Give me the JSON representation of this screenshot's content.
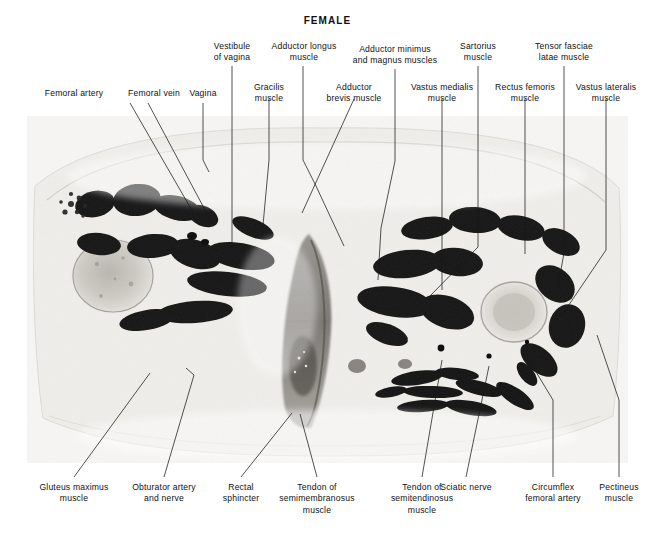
{
  "figure": {
    "title": "FEMALE",
    "type": "anatomical-cross-section-photograph",
    "caption_region": "labeled transverse section of female thighs and perineum"
  },
  "photo": {
    "alt": "black and white transverse anatomical section through female thighs",
    "background_color": "#f4f4f2",
    "ink_color": "#111111"
  },
  "labels": {
    "top_row_1": [
      {
        "id": "femoral-artery",
        "text": "Femoral artery",
        "x": 28,
        "y": 88,
        "w": 92
      },
      {
        "id": "femoral-vein",
        "text": "Femoral vein",
        "x": 112,
        "y": 88,
        "w": 84
      },
      {
        "id": "vagina",
        "text": "Vagina",
        "x": 177,
        "y": 88,
        "w": 52
      },
      {
        "id": "gracilis-muscle",
        "text": "Gracilis\nmuscle",
        "x": 240,
        "y": 82,
        "w": 58
      },
      {
        "id": "adductor-brevis-muscle",
        "text": "Adductor\nbrevis muscle",
        "x": 312,
        "y": 82,
        "w": 84
      },
      {
        "id": "vastus-medialis-muscle",
        "text": "Vastus medialis\nmuscle",
        "x": 396,
        "y": 82,
        "w": 92
      },
      {
        "id": "rectus-femoris-muscle",
        "text": "Rectus femoris\nmuscle",
        "x": 481,
        "y": 82,
        "w": 88
      },
      {
        "id": "vastus-lateralis-muscle",
        "text": "Vastus lateralis\nmuscle",
        "x": 560,
        "y": 82,
        "w": 92
      }
    ],
    "top_row_2": [
      {
        "id": "vestibule-of-vagina",
        "text": "Vestibule\nof vagina",
        "x": 201,
        "y": 41,
        "w": 62
      },
      {
        "id": "adductor-longus-muscle",
        "text": "Adductor longus\nmuscle",
        "x": 256,
        "y": 41,
        "w": 96
      },
      {
        "id": "adductor-minimus-magnus-muscles",
        "text": "Adductor minimus\nand magnus muscles",
        "x": 339,
        "y": 44,
        "w": 112
      },
      {
        "id": "sartorius-muscle",
        "text": "Sartorius\nmuscle",
        "x": 447,
        "y": 41,
        "w": 62
      },
      {
        "id": "tensor-fasciae-latae-muscle",
        "text": "Tensor fasciae\nlatae muscle",
        "x": 518,
        "y": 41,
        "w": 92
      }
    ],
    "bottom_row": [
      {
        "id": "gluteus-maximus-muscle",
        "text": "Gluteus maximus\nmuscle",
        "x": 26,
        "y": 482,
        "w": 96
      },
      {
        "id": "obturator-artery-and-nerve",
        "text": "Obturator artery\nand nerve",
        "x": 116,
        "y": 482,
        "w": 96
      },
      {
        "id": "rectal-sphincter",
        "text": "Rectal\nsphincter",
        "x": 210,
        "y": 482,
        "w": 62
      },
      {
        "id": "tendon-semimembranosus",
        "text": "Tendon of\nsemimembranosus\nmuscle",
        "x": 263,
        "y": 482,
        "w": 108
      },
      {
        "id": "tendon-semitendinosus",
        "text": "Tendon of\nsemitendinosus\nmuscle",
        "x": 372,
        "y": 482,
        "w": 100
      },
      {
        "id": "sciatic-nerve",
        "text": "Sciatic nerve",
        "x": 424,
        "y": 482,
        "w": 84
      },
      {
        "id": "circumflex-femoral-artery",
        "text": "Circumflex\nfemoral artery",
        "x": 505,
        "y": 482,
        "w": 96
      },
      {
        "id": "pectineus-muscle",
        "text": "Pectineus\nmuscle",
        "x": 585,
        "y": 482,
        "w": 68
      }
    ]
  },
  "leaders": {
    "description": "thin black pointer lines joining each label to its structure in the photograph",
    "stroke_color": "#1a1a1a",
    "stroke_width": 0.75,
    "paths": [
      {
        "id": "leader-femoral-artery",
        "points": "130,103 194,214"
      },
      {
        "id": "leader-femoral-vein",
        "points": "148,103 213,225"
      },
      {
        "id": "leader-vagina",
        "points": "203,103 203,160 209,172"
      },
      {
        "id": "leader-vestibule-of-vagina",
        "points": "232,66 232,245"
      },
      {
        "id": "leader-gracilis-muscle",
        "points": "269,99 269,160 262,236"
      },
      {
        "id": "leader-adductor-longus-muscle",
        "points": "303,66 303,160 316,186 344,246"
      },
      {
        "id": "leader-adductor-brevis-muscle",
        "points": "354,99 302,213"
      },
      {
        "id": "leader-adductor-minimus",
        "points": "395,69 395,161 381,228 378,280"
      },
      {
        "id": "leader-vastus-medialis-muscle",
        "points": "442,99 442,290"
      },
      {
        "id": "leader-sartorius-muscle",
        "points": "478,66 478,247 430,296"
      },
      {
        "id": "leader-rectus-femoris-muscle",
        "points": "525,99 525,254"
      },
      {
        "id": "leader-tensor-fasciae-latae",
        "points": "564,66 564,253 558,286"
      },
      {
        "id": "leader-vastus-lateralis-muscle",
        "points": "606,99 606,250 560,318"
      },
      {
        "id": "leader-gluteus-maximus-muscle",
        "points": "74,477 150,373"
      },
      {
        "id": "leader-obturator-artery-nerve",
        "points": "164,477 194,375 186,368"
      },
      {
        "id": "leader-rectal-sphincter",
        "points": "241,477 292,413"
      },
      {
        "id": "leader-tendon-semimembranosus",
        "points": "317,477 300,414"
      },
      {
        "id": "leader-tendon-semitendinosus",
        "points": "422,477 442,360"
      },
      {
        "id": "leader-sciatic-nerve",
        "points": "466,477 489,366"
      },
      {
        "id": "leader-circumflex-femoral-artery",
        "points": "553,477 553,400 527,357"
      },
      {
        "id": "leader-pectineus-muscle",
        "points": "619,477 619,400 597,335"
      }
    ]
  }
}
